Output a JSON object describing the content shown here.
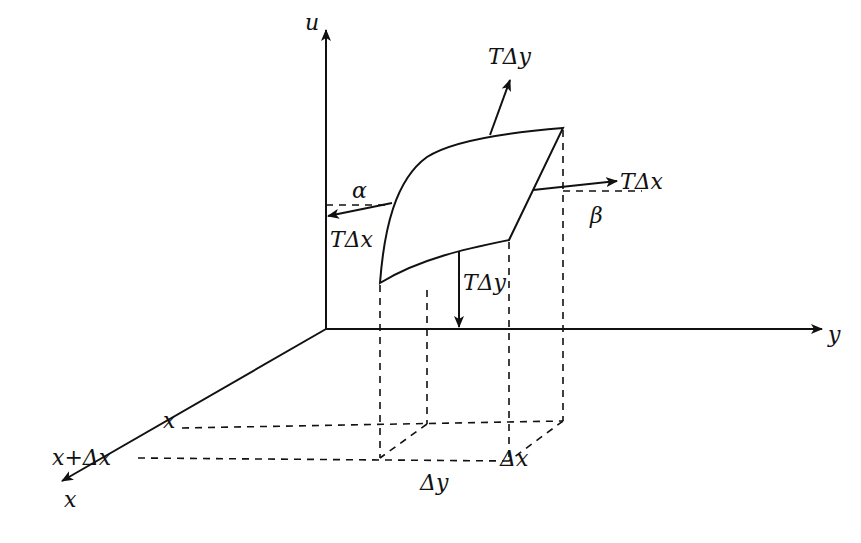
{
  "diagram": {
    "type": "vibrating membrane element tension diagram",
    "axes": {
      "u_label": "u",
      "y_label": "y",
      "x_label": "x"
    },
    "forces": {
      "top_label": "TΔy",
      "left_label": "TΔx",
      "right_label": "TΔx",
      "bottom_label": "TΔy"
    },
    "angles": {
      "alpha": "α",
      "beta": "β"
    },
    "floor_labels": {
      "x_mark": "x",
      "x_plus_dx": "x+Δx",
      "delta_y": "Δy",
      "delta_x": "Δx"
    },
    "colors": {
      "stroke": "#111111",
      "background": "#ffffff"
    }
  }
}
